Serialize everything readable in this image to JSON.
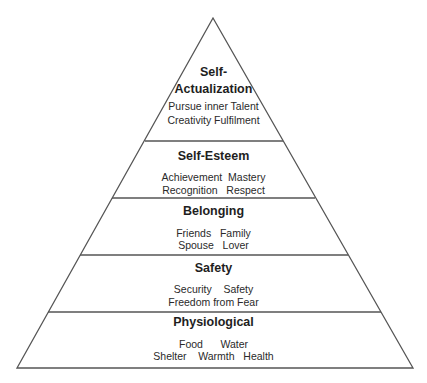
{
  "diagram": {
    "type": "pyramid",
    "stroke_color": "#555555",
    "background": "#ffffff",
    "layers": [
      {
        "name": "self-actualization",
        "title_line1": "Self-",
        "title_line2": "Actualization",
        "items_line1": "Pursue inner Talent",
        "items_line2": "Creativity Fulfilment"
      },
      {
        "name": "self-esteem",
        "title": "Self-Esteem",
        "items_line1": "Achievement  Mastery",
        "items_line2": "Recognition   Respect"
      },
      {
        "name": "belonging",
        "title": "Belonging",
        "items_line1": "Friends   Family",
        "items_line2": "Spouse   Lover"
      },
      {
        "name": "safety",
        "title": "Safety",
        "items_line1": "Security    Safety",
        "items_line2": "Freedom from Fear"
      },
      {
        "name": "physiological",
        "title": "Physiological",
        "items_line1": "Food      Water",
        "items_line2": "Shelter    Warmth   Health"
      }
    ]
  }
}
